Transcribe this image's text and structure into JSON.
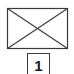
{
  "diagram": {
    "placeholder": {
      "icon": "image-placeholder-icon",
      "stroke_color": "#3a3a3a",
      "rect": {
        "x": 7,
        "y": 8,
        "width": 60,
        "height": 40
      }
    },
    "label": {
      "text": "1",
      "border_color": "#3a3a3a"
    }
  }
}
